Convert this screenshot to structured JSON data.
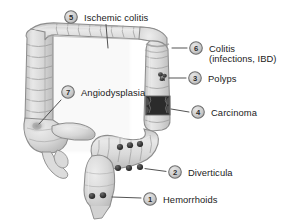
{
  "figure": {
    "background_color": "#ffffff",
    "colors": {
      "colon_fill": "#d6d6d6",
      "colon_fill_light": "#e4e4e4",
      "colon_outline": "#8d8d8d",
      "lesion_dark": "#3b3b3b",
      "badge_fill": "#cfcfcf",
      "badge_border": "#6e6e6e",
      "text": "#1b1b1b",
      "leader_line": "#4a4a4a"
    },
    "markers": [
      {
        "id": "hemorrhoids",
        "number": "1",
        "label": "Hemorrhoids",
        "label_line2": "",
        "badge_x": 150,
        "badge_y": 199,
        "text_x": 163,
        "text_y": 202.6,
        "leader": [
          [
            112,
            198
          ],
          [
            141,
            198
          ]
        ],
        "lesion_site": "rectum"
      },
      {
        "id": "diverticula",
        "number": "2",
        "label": "Diverticula",
        "label_line2": "",
        "badge_x": 175,
        "badge_y": 172,
        "text_x": 188,
        "text_y": 175.6,
        "leader": [
          [
            145,
            169
          ],
          [
            166,
            171
          ]
        ],
        "lesion_site": "sigmoid-colon"
      },
      {
        "id": "polyps",
        "number": "3",
        "label": "Polyps",
        "label_line2": "",
        "badge_x": 195,
        "badge_y": 78,
        "text_x": 208,
        "text_y": 81.6,
        "leader": [
          [
            170,
            78
          ],
          [
            186,
            78
          ]
        ],
        "lesion_site": "descending-colon"
      },
      {
        "id": "carcinoma",
        "number": "4",
        "label": "Carcinoma",
        "label_line2": "",
        "badge_x": 198,
        "badge_y": 112,
        "text_x": 211,
        "text_y": 115.6,
        "leader": [
          [
            172,
            110
          ],
          [
            189,
            112
          ]
        ],
        "lesion_site": "descending-colon-stricture"
      },
      {
        "id": "ischemic-colitis",
        "number": "5",
        "label": "Ischemic colitis",
        "label_line2": "",
        "badge_x": 71,
        "badge_y": 17,
        "text_x": 84,
        "text_y": 20.6,
        "leader": [
          [
            104,
            26
          ],
          [
            108,
            48
          ]
        ],
        "lesion_site": "transverse-colon"
      },
      {
        "id": "colitis",
        "number": "6",
        "label": "Colitis",
        "label_line2": "(infections, IBD)",
        "badge_x": 196,
        "badge_y": 48,
        "text_x": 209,
        "text_y": 51.6,
        "text2_x": 209,
        "text2_y": 62.4,
        "leader": [
          [
            173,
            48
          ],
          [
            187,
            48
          ]
        ],
        "lesion_site": "descending-colon-wall"
      },
      {
        "id": "angiodysplasia",
        "number": "7",
        "label": "Angiodysplasia",
        "label_line2": "",
        "badge_x": 68,
        "badge_y": 92,
        "text_x": 81,
        "text_y": 95.6,
        "leader": [
          [
            62,
            100
          ],
          [
            38,
            124
          ]
        ],
        "lesion_site": "cecum"
      }
    ],
    "lesion_dots": {
      "hemorrhoids": [
        [
          92,
          196
        ],
        [
          103,
          195
        ]
      ],
      "diverticula_upper": [
        [
          120,
          147
        ],
        [
          130,
          145
        ],
        [
          140,
          144
        ]
      ],
      "diverticula_lower": [
        [
          118,
          168
        ],
        [
          129,
          168
        ],
        [
          140,
          167
        ]
      ]
    }
  }
}
